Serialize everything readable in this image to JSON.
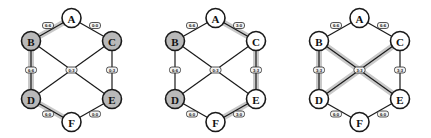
{
  "figure": {
    "type": "graph-diagram",
    "panel_count": 3,
    "colors": {
      "node_fill_highlighted": "#b9b9b9",
      "node_fill_plain": "#ffffff",
      "node_stroke": "#1a1a1a",
      "edge_stroke": "#1a1a1a",
      "edge_glow": "#c9c9c9",
      "label_box_fill": "#f2f2f2",
      "background": "#ffffff"
    }
  },
  "node_positions": {
    "A": {
      "x": 71.5,
      "y": 18
    },
    "B": {
      "x": 31,
      "y": 41
    },
    "C": {
      "x": 112,
      "y": 41
    },
    "D": {
      "x": 31,
      "y": 99
    },
    "E": {
      "x": 112,
      "y": 99
    },
    "F": {
      "x": 71.5,
      "y": 122
    }
  },
  "edges": [
    {
      "id": "AB",
      "from": "A",
      "to": "B",
      "label_x": 48,
      "label_y": 25.5
    },
    {
      "id": "AC",
      "from": "A",
      "to": "C",
      "label_x": 95,
      "label_y": 25.5
    },
    {
      "id": "BD",
      "from": "B",
      "to": "D",
      "label_x": 31,
      "label_y": 70
    },
    {
      "id": "CE",
      "from": "C",
      "to": "E",
      "label_x": 112,
      "label_y": 70
    },
    {
      "id": "DF",
      "from": "D",
      "to": "F",
      "label_x": 48,
      "label_y": 114
    },
    {
      "id": "EF",
      "from": "E",
      "to": "F",
      "label_x": 95,
      "label_y": 114
    },
    {
      "id": "BE",
      "from": "B",
      "to": "E",
      "label_x": 71.5,
      "label_y": 70
    },
    {
      "id": "CD",
      "from": "C",
      "to": "D",
      "label_x": 71.5,
      "label_y": 70
    }
  ],
  "panels": [
    {
      "name": "panel-1",
      "offset_x": 0,
      "nodes": [
        {
          "id": "A",
          "label": "A",
          "filled": false
        },
        {
          "id": "B",
          "label": "B",
          "filled": true
        },
        {
          "id": "C",
          "label": "C",
          "filled": true
        },
        {
          "id": "D",
          "label": "D",
          "filled": true
        },
        {
          "id": "E",
          "label": "E",
          "filled": true
        },
        {
          "id": "F",
          "label": "F",
          "filled": false
        }
      ],
      "edge_labels": {
        "AB": "6:6",
        "AC": "0:0",
        "BD": "6:6",
        "CE": "0:3",
        "DF": "6:0",
        "EF": "0:0",
        "BE": "0:3",
        "CD": "0:3"
      },
      "highlighted_edges": [
        "AB",
        "BD",
        "DF"
      ]
    },
    {
      "name": "panel-2",
      "offset_x": 144,
      "nodes": [
        {
          "id": "A",
          "label": "A",
          "filled": false
        },
        {
          "id": "B",
          "label": "B",
          "filled": true
        },
        {
          "id": "C",
          "label": "C",
          "filled": false
        },
        {
          "id": "D",
          "label": "D",
          "filled": true
        },
        {
          "id": "E",
          "label": "E",
          "filled": false
        },
        {
          "id": "F",
          "label": "F",
          "filled": false
        }
      ],
      "edge_labels": {
        "AB": "6:6",
        "AC": "3:0",
        "BD": "6:6",
        "CE": "3:3",
        "DF": "6:0",
        "EF": "3:0",
        "BE": "0:3",
        "CD": "0:3"
      },
      "highlighted_edges": [
        "AC",
        "CE",
        "EF"
      ]
    },
    {
      "name": "panel-3",
      "offset_x": 288,
      "nodes": [
        {
          "id": "A",
          "label": "A",
          "filled": false
        },
        {
          "id": "B",
          "label": "B",
          "filled": false
        },
        {
          "id": "C",
          "label": "C",
          "filled": false
        },
        {
          "id": "D",
          "label": "D",
          "filled": false
        },
        {
          "id": "E",
          "label": "E",
          "filled": false
        },
        {
          "id": "F",
          "label": "F",
          "filled": false
        }
      ],
      "edge_labels": {
        "AB": "6:6",
        "AC": "6:6",
        "BD": "3:3",
        "CE": "3:3",
        "DF": "6:0",
        "EF": "6:0",
        "BE": "3:3",
        "CD": "3:3"
      },
      "highlighted_edges": [
        "BD",
        "BE",
        "CD"
      ]
    }
  ]
}
